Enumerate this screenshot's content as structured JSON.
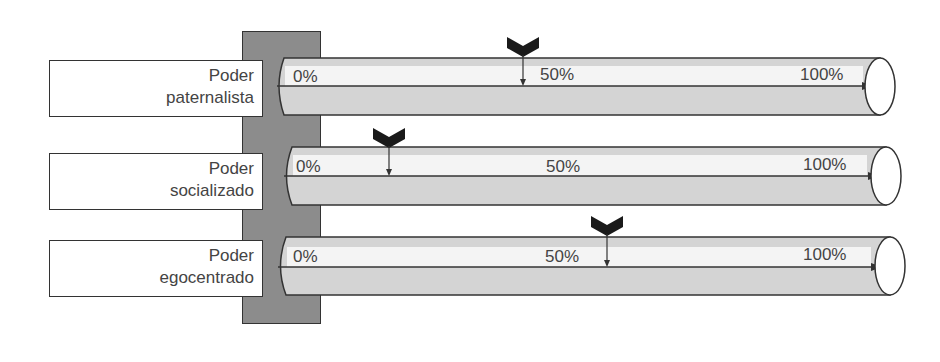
{
  "diagram": {
    "rows": [
      {
        "label_line1": "Poder",
        "label_line2": "paternalista",
        "ticks": {
          "start": "0%",
          "mid": "50%",
          "end": "100%"
        },
        "marker_percent": 49
      },
      {
        "label_line1": "Poder",
        "label_line2": "socializado",
        "ticks": {
          "start": "0%",
          "mid": "50%",
          "end": "100%"
        },
        "marker_percent": 21
      },
      {
        "label_line1": "Poder",
        "label_line2": "egocentrado",
        "ticks": {
          "start": "0%",
          "mid": "50%",
          "end": "100%"
        },
        "marker_percent": 60
      }
    ],
    "colors": {
      "post": "#8c8c8c",
      "tube": "#d4d4d4",
      "tube_highlight": "#f4f4f4",
      "outline": "#333333",
      "marker": "#1a1a1a"
    }
  }
}
